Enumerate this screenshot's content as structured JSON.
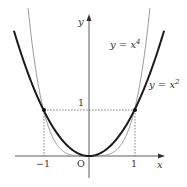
{
  "chart_data": {
    "type": "line",
    "title": "",
    "xlabel": "x",
    "ylabel": "y",
    "origin_label": "O",
    "x_ticks": [
      {
        "value": -1,
        "label": "−1"
      },
      {
        "value": 1,
        "label": "1"
      }
    ],
    "y_ticks": [
      {
        "value": 1,
        "label": "1"
      }
    ],
    "xlim": [
      -1.65,
      1.65
    ],
    "ylim": [
      -0.4,
      3.1
    ],
    "grid": false,
    "legend": "inline labels",
    "series": [
      {
        "name": "y = x^2",
        "label_main": "y = x",
        "label_sup": "2",
        "function": "x^2",
        "color": "#1a1a1a",
        "stroke_width": 2.0
      },
      {
        "name": "y = x^4",
        "label_main": "y = x",
        "label_sup": "4",
        "function": "x^4",
        "color": "#9a9a9a",
        "stroke_width": 1.0
      }
    ],
    "intersection_points": [
      {
        "x": -1,
        "y": 1
      },
      {
        "x": 1,
        "y": 1
      },
      {
        "x": 0,
        "y": 0
      }
    ],
    "guide_lines": "dashed lines from (±1,1) to both axes"
  }
}
